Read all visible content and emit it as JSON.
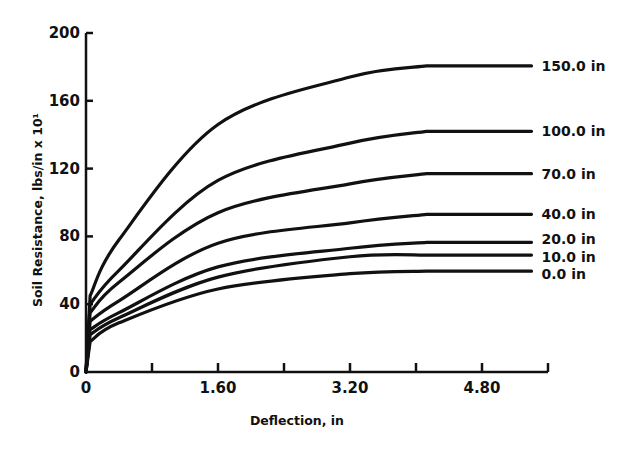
{
  "chart_data": {
    "type": "line",
    "title": "",
    "xlabel": "Deflection, in",
    "ylabel": "Soil Resistance, lbs/in x 10¹",
    "xlim": [
      0,
      5.6
    ],
    "ylim": [
      0,
      200
    ],
    "x_ticks": [
      0,
      0.8,
      1.6,
      2.4,
      3.2,
      4.0,
      4.8,
      5.6
    ],
    "x_tick_labels": [
      "0",
      "",
      "1.60",
      "",
      "3.20",
      "",
      "4.80",
      ""
    ],
    "y_ticks": [
      0,
      40,
      80,
      120,
      160,
      200
    ],
    "y_tick_labels": [
      "0",
      "40",
      "80",
      "120",
      "160",
      "200"
    ],
    "grid": false,
    "legend": "inline labels at right end of each curve",
    "x": [
      0,
      0.05,
      0.4,
      1.6,
      3.2,
      4.13,
      5.4
    ],
    "series": [
      {
        "name": "150.0 in",
        "values": [
          0,
          45,
          78,
          146,
          174,
          180.6,
          180.6
        ]
      },
      {
        "name": "100.0 in",
        "values": [
          0,
          40,
          60,
          113,
          135,
          142,
          142
        ]
      },
      {
        "name": "70.0 in",
        "values": [
          0,
          35,
          53,
          94,
          111,
          117,
          117
        ]
      },
      {
        "name": "40.0 in",
        "values": [
          0,
          30,
          42,
          76,
          88,
          93,
          93
        ]
      },
      {
        "name": "20.0 in",
        "values": [
          0,
          25,
          35,
          62,
          73,
          76.5,
          76.5
        ]
      },
      {
        "name": "10.0 in",
        "values": [
          0,
          22,
          32,
          56,
          68,
          69,
          69
        ]
      },
      {
        "name": "0.0 in",
        "values": [
          0,
          18,
          29,
          49,
          58,
          59.5,
          59.5
        ]
      }
    ]
  }
}
